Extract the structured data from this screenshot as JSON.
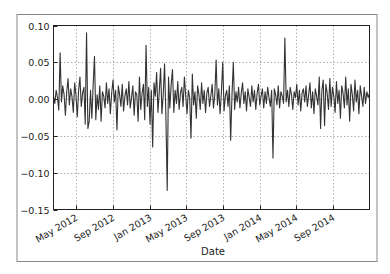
{
  "figure": {
    "frame_color": "#888888",
    "line_color": "#333333",
    "grid_color": "#b0b0b0",
    "axis_color": "#222222"
  },
  "chart_data": {
    "type": "line",
    "title": "",
    "xlabel": "Date",
    "ylabel": "",
    "ylim": [
      -0.15,
      0.1
    ],
    "yticks": [
      0.1,
      0.05,
      0.0,
      -0.05,
      -0.1,
      -0.15
    ],
    "ytick_labels": [
      "0.10",
      "0.05",
      "0.00",
      "−0.05",
      "−0.10",
      "−0.15"
    ],
    "xlim": [
      "2012-02-15",
      "2014-12-31"
    ],
    "xticks": [
      "2012-05-01",
      "2012-09-01",
      "2013-01-01",
      "2013-05-01",
      "2013-09-01",
      "2014-01-01",
      "2014-05-01",
      "2014-09-01"
    ],
    "xtick_labels": [
      "May 2012",
      "Sep 2012",
      "Jan 2013",
      "May 2013",
      "Sep 2013",
      "Jan 2014",
      "May 2014",
      "Sep 2014"
    ],
    "grid": true,
    "legend": null,
    "series": [
      {
        "name": "returns",
        "x_start": "2012-02-15",
        "x_end": "2014-12-31",
        "values": [
          0.004,
          -0.006,
          0.012,
          0.002,
          -0.015,
          0.063,
          -0.004,
          0.018,
          0.006,
          -0.022,
          0.01,
          0.028,
          -0.008,
          0.014,
          0.003,
          -0.018,
          0.022,
          0.005,
          -0.024,
          0.012,
          0.03,
          -0.01,
          0.008,
          0.016,
          -0.034,
          0.09,
          -0.04,
          -0.03,
          0.012,
          -0.026,
          0.02,
          0.058,
          -0.028,
          0.006,
          -0.014,
          0.018,
          -0.03,
          0.01,
          0.004,
          -0.012,
          0.022,
          -0.006,
          0.014,
          -0.02,
          0.008,
          0.026,
          -0.004,
          0.012,
          -0.042,
          0.018,
          0.006,
          -0.01,
          0.02,
          -0.016,
          0.004,
          0.014,
          -0.008,
          0.024,
          -0.012,
          0.002,
          0.018,
          -0.022,
          0.01,
          0.006,
          -0.03,
          0.03,
          -0.014,
          0.008,
          0.02,
          -0.028,
          0.073,
          -0.01,
          0.016,
          -0.034,
          0.012,
          -0.065,
          0.022,
          0.004,
          0.036,
          -0.018,
          0.01,
          0.042,
          -0.02,
          0.006,
          0.048,
          -0.022,
          -0.124,
          0.03,
          -0.012,
          0.02,
          0.04,
          -0.018,
          0.012,
          -0.006,
          0.024,
          -0.014,
          0.008,
          0.016,
          -0.01,
          0.03,
          0.004,
          -0.02,
          0.012,
          0.002,
          -0.053,
          0.034,
          -0.008,
          0.01,
          -0.026,
          0.018,
          0.006,
          -0.014,
          0.022,
          -0.006,
          0.012,
          -0.018,
          0.008,
          0.016,
          -0.01,
          0.004,
          0.02,
          -0.012,
          0.006,
          0.053,
          -0.008,
          0.014,
          -0.02,
          0.01,
          0.05,
          -0.016,
          0.004,
          0.012,
          -0.01,
          0.018,
          -0.056,
          0.006,
          0.05,
          -0.014,
          0.01,
          -0.004,
          0.016,
          -0.012,
          0.008,
          0.022,
          -0.006,
          0.01,
          -0.016,
          0.014,
          0.002,
          -0.01,
          0.018,
          -0.004,
          0.012,
          -0.014,
          0.008,
          0.02,
          -0.008,
          0.004,
          0.014,
          -0.012,
          0.01,
          -0.006,
          0.016,
          0.002,
          -0.01,
          0.012,
          -0.08,
          0.014,
          0.006,
          -0.008,
          0.018,
          -0.012,
          0.01,
          0.004,
          -0.006,
          0.083,
          -0.004,
          0.012,
          -0.01,
          0.016,
          0.006,
          -0.014,
          0.01,
          0.002,
          0.02,
          -0.008,
          0.012,
          -0.016,
          0.008,
          0.014,
          -0.004,
          0.018,
          -0.01,
          0.006,
          0.022,
          -0.012,
          0.01,
          -0.02,
          0.014,
          0.004,
          -0.008,
          0.03,
          -0.04,
          0.012,
          0.026,
          -0.036,
          0.02,
          0.008,
          -0.014,
          0.028,
          -0.01,
          0.016,
          0.004,
          -0.018,
          0.024,
          -0.006,
          0.012,
          -0.026,
          0.018,
          0.008,
          -0.012,
          0.03,
          -0.008,
          0.014,
          -0.03,
          0.02,
          0.006,
          -0.016,
          0.026,
          -0.004,
          0.012,
          -0.02,
          0.018,
          0.004,
          -0.01,
          0.016,
          -0.006,
          0.01,
          0.002,
          0.008
        ]
      }
    ]
  }
}
